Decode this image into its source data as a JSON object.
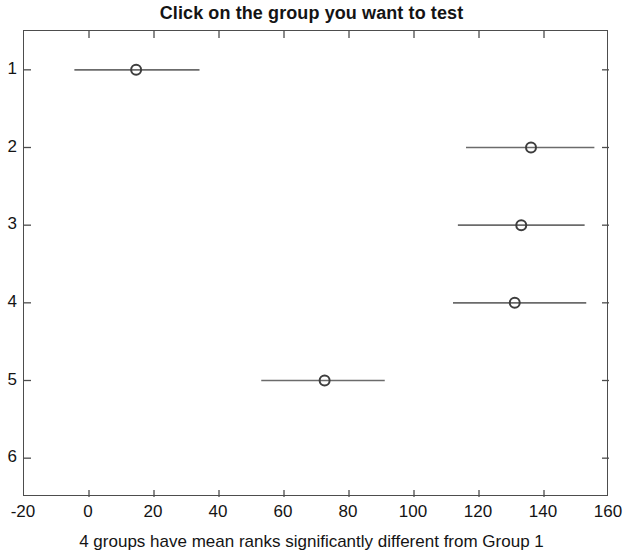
{
  "chart_data": {
    "type": "scatter",
    "title": "Click on the group you want to test",
    "caption": "4 groups have mean ranks significantly different from Group 1",
    "xlabel": "",
    "ylabel": "",
    "xlim": [
      -20,
      160
    ],
    "ylim": [
      0.5,
      6.5
    ],
    "xticks": [
      -20,
      0,
      20,
      40,
      60,
      80,
      100,
      120,
      140,
      160
    ],
    "xtick_labels": [
      "-20",
      "0",
      "20",
      "40",
      "60",
      "80",
      "100",
      "120",
      "140",
      "160"
    ],
    "yticks": [
      1,
      2,
      3,
      4,
      5,
      6
    ],
    "ytick_labels": [
      "1",
      "2",
      "3",
      "4",
      "5",
      "6"
    ],
    "grid": false,
    "legend": "none",
    "marker": "open-circle",
    "series_name": "mean rank with comparison interval",
    "colors": {
      "marker": "#3d3d3d",
      "interval_line": "#6b6b6b",
      "axis": "#4d4d4d",
      "text": "#141414",
      "background": "#ffffff"
    },
    "points": [
      {
        "group": "1",
        "y": 1,
        "mean_rank": 14.5,
        "lower": -4.5,
        "upper": 34.0
      },
      {
        "group": "2",
        "y": 2,
        "mean_rank": 136.0,
        "lower": 116.0,
        "upper": 155.5
      },
      {
        "group": "3",
        "y": 3,
        "mean_rank": 133.0,
        "lower": 113.5,
        "upper": 152.5
      },
      {
        "group": "4",
        "y": 4,
        "mean_rank": 131.0,
        "lower": 112.0,
        "upper": 153.0
      },
      {
        "group": "5",
        "y": 5,
        "mean_rank": 72.5,
        "lower": 53.0,
        "upper": 91.0
      }
    ]
  }
}
